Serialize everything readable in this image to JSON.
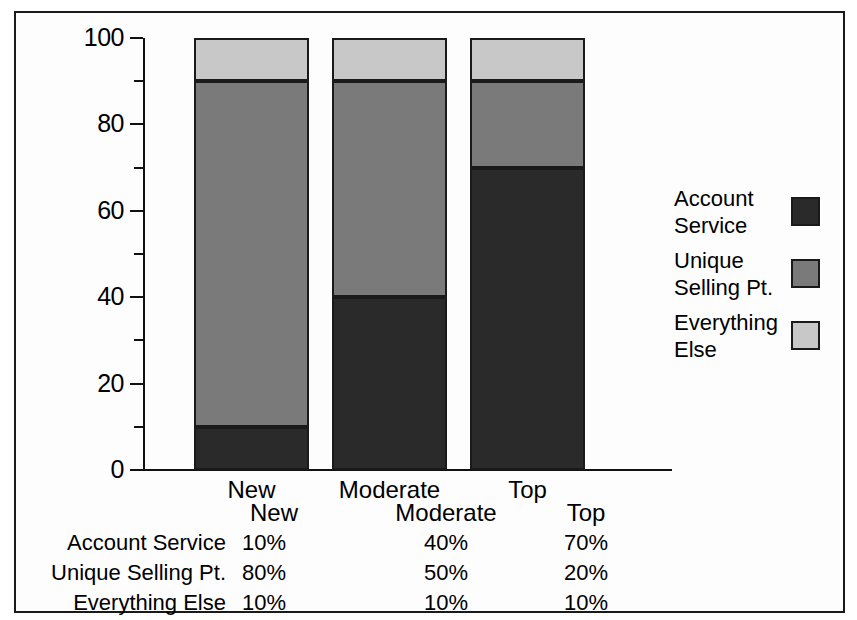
{
  "chart_data": {
    "type": "bar",
    "subtype": "stacked-bar-100",
    "title": "",
    "xlabel": "",
    "ylabel": "",
    "ylim": [
      0,
      100
    ],
    "grid": false,
    "legend_position": "right",
    "categories": [
      "New",
      "Moderate",
      "Top"
    ],
    "series": [
      {
        "name": "Account Service",
        "values": [
          10,
          40,
          70
        ],
        "color": "#2a2a2a"
      },
      {
        "name": "Unique Selling Pt.",
        "values": [
          80,
          50,
          20
        ],
        "color": "#7a7a7a"
      },
      {
        "name": "Everything Else",
        "values": [
          10,
          10,
          10
        ],
        "color": "#c8c8c8"
      }
    ],
    "y_ticks_major": [
      0,
      20,
      40,
      60,
      80,
      100
    ],
    "y_ticks_minor": [
      10,
      30,
      50,
      70,
      90
    ],
    "y_tick_labels": [
      "0",
      "20",
      "40",
      "60",
      "80",
      "100"
    ]
  },
  "axis": {
    "labels": {
      "t0": "0",
      "t20": "20",
      "t40": "40",
      "t60": "60",
      "t80": "80",
      "t100": "100"
    }
  },
  "categories": {
    "c0": "New",
    "c1": "Moderate",
    "c2": "Top"
  },
  "legend": {
    "items": [
      {
        "label_line1": "Account",
        "label_line2": "Service"
      },
      {
        "label_line1": "Unique",
        "label_line2": "Selling Pt."
      },
      {
        "label_line1": "Everything",
        "label_line2": "Else"
      }
    ]
  },
  "table": {
    "header": {
      "blank": "",
      "c0": "New",
      "c1": "Moderate",
      "c2": "Top"
    },
    "rows": [
      {
        "label": "Account Service",
        "v0": "10%",
        "v1": "40%",
        "v2": "70%"
      },
      {
        "label": "Unique Selling Pt.",
        "v0": "80%",
        "v1": "50%",
        "v2": "20%"
      },
      {
        "label": "Everything Else",
        "v0": "10%",
        "v1": "10%",
        "v2": "10%"
      }
    ]
  },
  "colors": {
    "account_service": "#2a2a2a",
    "unique_selling_pt": "#7a7a7a",
    "everything_else": "#c8c8c8",
    "outline": "#1a1a1a"
  }
}
